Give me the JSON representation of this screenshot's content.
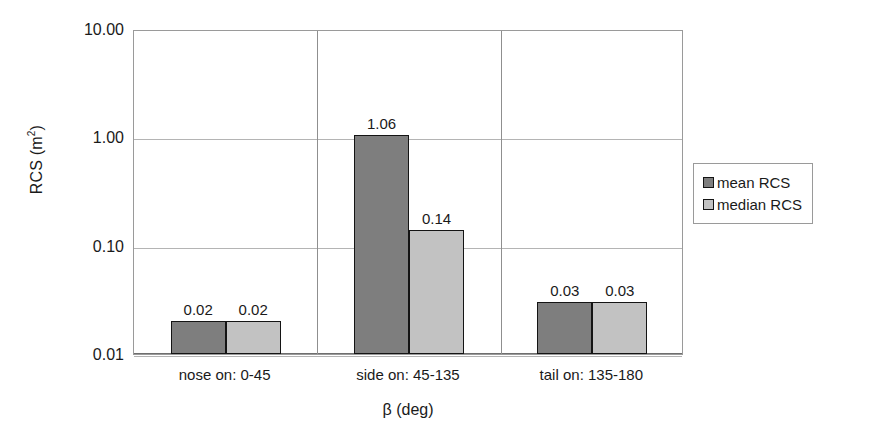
{
  "chart_data": {
    "type": "bar",
    "title": "",
    "xlabel": "β (deg)",
    "ylabel": "RCS (m²)",
    "ylabel_base": "RCS (m",
    "ylabel_exponent": "2",
    "ylabel_close": ")",
    "yscale": "log",
    "ylim": [
      0.01,
      10.0
    ],
    "ytick_labels": [
      "10.00",
      "1.00",
      "0.10",
      "0.01"
    ],
    "ytick_values": [
      10.0,
      1.0,
      0.1,
      0.01
    ],
    "grid": "horizontal and vertical category separators",
    "legend_position": "right",
    "categories": [
      "nose on: 0-45",
      "side on: 45-135",
      "tail on: 135-180"
    ],
    "series": [
      {
        "name": "mean RCS",
        "color": "#7e7e7e",
        "values": [
          0.02,
          1.06,
          0.03
        ],
        "labels": [
          "0.02",
          "1.06",
          "0.03"
        ]
      },
      {
        "name": "median RCS",
        "color": "#c2c2c2",
        "values": [
          0.02,
          0.14,
          0.03
        ],
        "labels": [
          "0.02",
          "0.14",
          "0.03"
        ]
      }
    ]
  },
  "legend": {
    "entries": [
      {
        "label": "mean RCS",
        "swatch": "mean"
      },
      {
        "label": "median RCS",
        "swatch": "median"
      }
    ]
  },
  "colors": {
    "mean_bar": "#7e7e7e",
    "median_bar": "#c2c2c2",
    "bar_outline": "#141414",
    "gridline": "#b4b4b4",
    "axis": "#9a9a9a",
    "text": "#1a1a1a",
    "background": "#ffffff"
  }
}
